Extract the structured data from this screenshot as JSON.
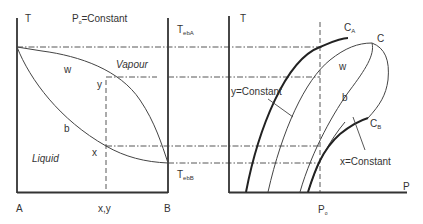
{
  "left_panel": {
    "axis_label": "T",
    "title_prefix": "P",
    "title_sub": "o",
    "title_suffix": "=Constant",
    "region_vapour": "Vapour",
    "region_liquid": "Liquid",
    "curve_dew": "w",
    "curve_bubble": "b",
    "point_y": "y",
    "point_x": "x",
    "x_label_left": "A",
    "x_label_mid": "x,y",
    "x_label_right": "B",
    "t_eb_a_main": "T",
    "t_eb_a_sub": "ebA",
    "t_eb_b_main": "T",
    "t_eb_b_sub": "ebB"
  },
  "right_panel": {
    "axis_label_y": "T",
    "axis_label_x": "P",
    "critical_a_main": "C",
    "critical_a_sub": "A",
    "critical_mix": "C",
    "critical_b_main": "C",
    "critical_b_sub": "B",
    "curve_dew": "w",
    "curve_bubble": "b",
    "label_y_constant": "y=Constant",
    "label_x_constant": "x=Constant",
    "p_label_main": "P",
    "p_label_sub": "o"
  }
}
